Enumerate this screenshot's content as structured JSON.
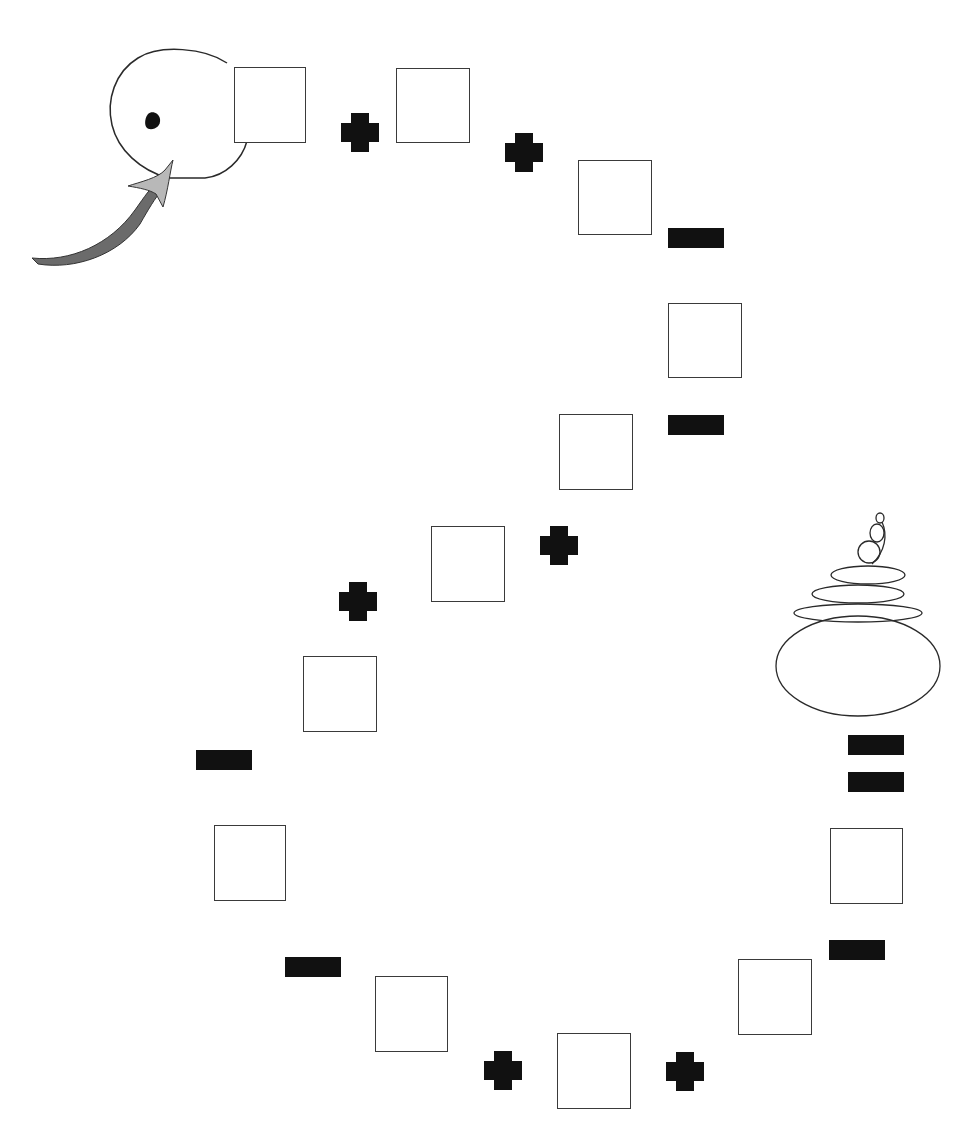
{
  "game": {
    "type": "number-line-path-board",
    "colors": {
      "background": "#ffffff",
      "square_border": "#3a3a3a",
      "token": "#111111",
      "arrow_dark": "#6b6b6b",
      "arrow_light": "#b8b8b8"
    },
    "start": {
      "icon": "head-with-eye-icon",
      "arrow": "start-arrow-icon"
    },
    "finish": {
      "icon": "stacked-stones-icon"
    },
    "squares": [
      {
        "id": 1,
        "x": 234,
        "y": 67,
        "w": 72,
        "h": 76
      },
      {
        "id": 2,
        "x": 396,
        "y": 68,
        "w": 74,
        "h": 75
      },
      {
        "id": 3,
        "x": 578,
        "y": 160,
        "w": 74,
        "h": 75
      },
      {
        "id": 4,
        "x": 668,
        "y": 303,
        "w": 74,
        "h": 75
      },
      {
        "id": 5,
        "x": 559,
        "y": 414,
        "w": 74,
        "h": 76
      },
      {
        "id": 6,
        "x": 431,
        "y": 526,
        "w": 74,
        "h": 76
      },
      {
        "id": 7,
        "x": 303,
        "y": 656,
        "w": 74,
        "h": 76
      },
      {
        "id": 8,
        "x": 214,
        "y": 825,
        "w": 72,
        "h": 76
      },
      {
        "id": 9,
        "x": 375,
        "y": 976,
        "w": 73,
        "h": 76
      },
      {
        "id": 10,
        "x": 557,
        "y": 1033,
        "w": 74,
        "h": 76
      },
      {
        "id": 11,
        "x": 738,
        "y": 959,
        "w": 74,
        "h": 76
      },
      {
        "id": 12,
        "x": 830,
        "y": 828,
        "w": 73,
        "h": 76
      }
    ],
    "plus_tokens": [
      {
        "x": 341,
        "y": 113
      },
      {
        "x": 505,
        "y": 133
      },
      {
        "x": 540,
        "y": 526
      },
      {
        "x": 339,
        "y": 582
      },
      {
        "x": 484,
        "y": 1051
      },
      {
        "x": 666,
        "y": 1052
      }
    ],
    "minus_tokens": [
      {
        "x": 668,
        "y": 228
      },
      {
        "x": 668,
        "y": 415
      },
      {
        "x": 196,
        "y": 750
      },
      {
        "x": 285,
        "y": 957
      },
      {
        "x": 829,
        "y": 940
      },
      {
        "x": 848,
        "y": 735
      },
      {
        "x": 848,
        "y": 772
      }
    ]
  }
}
